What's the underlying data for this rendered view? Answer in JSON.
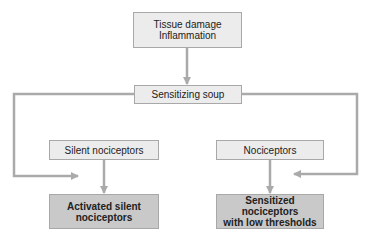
{
  "diagram": {
    "nodes": {
      "tissue_damage": {
        "line1": "Tissue damage",
        "line2": "Inflammation"
      },
      "sensitizing_soup": {
        "label": "Sensitizing soup"
      },
      "silent_nociceptors": {
        "label": "Silent nociceptors"
      },
      "nociceptors": {
        "label": "Nociceptors"
      },
      "activated_silent": {
        "line1": "Activated silent",
        "line2": "nociceptors"
      },
      "sensitized": {
        "line1": "Sensitized nociceptors",
        "line2": "with low thresholds"
      }
    },
    "edges": [
      {
        "from": "tissue_damage",
        "to": "sensitizing_soup"
      },
      {
        "from": "sensitizing_soup",
        "to": "activated_silent",
        "route": "left"
      },
      {
        "from": "sensitizing_soup",
        "to": "sensitized",
        "route": "right"
      },
      {
        "from": "silent_nociceptors",
        "to": "activated_silent"
      },
      {
        "from": "nociceptors",
        "to": "sensitized"
      }
    ],
    "colors": {
      "line": "#aaaaaa",
      "light_fill": "#ececec",
      "dark_fill": "#c9c9c9",
      "border": "#a8a8a8"
    }
  }
}
